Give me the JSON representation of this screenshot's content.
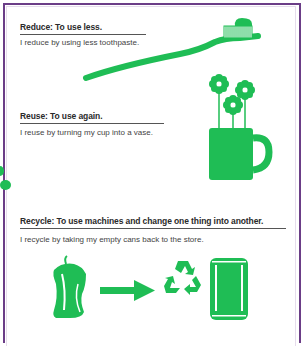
{
  "colors": {
    "frame": "#6b3d87",
    "accent_green": "#1fbd55",
    "text": "#2a2a2a"
  },
  "sections": [
    {
      "title": "Reduce: To use less.",
      "body": "I reduce by using less toothpaste.",
      "illustration": "toothbrush-icon"
    },
    {
      "title": "Reuse: To use again.",
      "body": "I reuse by turning my cup into a vase.",
      "illustration": "flower-mug-icon"
    },
    {
      "title": "Recycle: To use machines and change one thing into another.",
      "body": "I recycle by taking my empty cans back to the store.",
      "illustration": [
        "crushed-can-icon",
        "arrow-right-icon",
        "recycle-icon",
        "new-can-icon"
      ]
    }
  ]
}
